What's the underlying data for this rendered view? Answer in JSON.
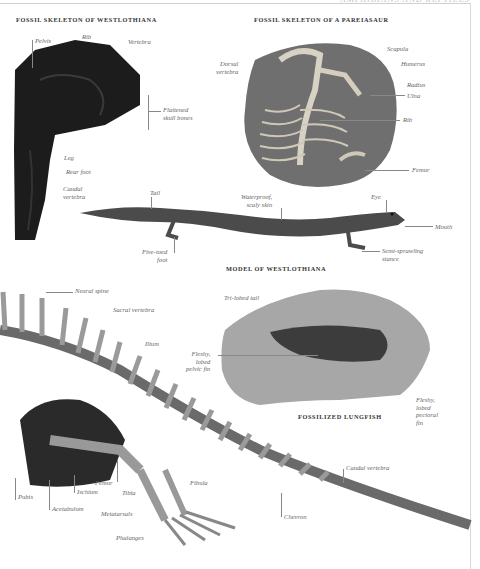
{
  "page": {
    "running_head": "AMPHIBIANS AND REPTILES"
  },
  "sections": {
    "westlothiana_fossil": {
      "title": "FOSSIL SKELETON OF WESTLOTHIANA",
      "labels": {
        "pelvis": "Pelvis",
        "rib": "Rib",
        "vertebra": "Vertebra",
        "flattened_skull_1": "Flattened",
        "flattened_skull_2": "skull bones",
        "leg": "Leg",
        "rear_foot": "Rear foot",
        "caudal_1": "Caudal",
        "caudal_2": "vertebra"
      }
    },
    "pareiasaur_fossil": {
      "title": "FOSSIL SKELETON OF A PAREIASAUR",
      "labels": {
        "dorsal_1": "Dorsal",
        "dorsal_2": "vertebra",
        "scapula": "Scapula",
        "humerus": "Humerus",
        "radius": "Radius",
        "ulna": "Ulna",
        "rib": "Rib",
        "femur": "Femur"
      }
    },
    "westlothiana_model": {
      "title": "MODEL OF WESTLOTHIANA",
      "labels": {
        "tail": "Tail",
        "skin_1": "Waterproof,",
        "skin_2": "scaly skin",
        "eye": "Eye",
        "mouth": "Mouth",
        "foot_1": "Five-toed",
        "foot_2": "foot",
        "stance_1": "Semi-sprawling",
        "stance_2": "stance"
      }
    },
    "lungfish_fossil": {
      "title": "FOSSILIZED LUNGFISH",
      "labels": {
        "tail": "Tri-lobed tail",
        "pelvic_1": "Fleshy,",
        "pelvic_2": "lobed",
        "pelvic_3": "pelvic fin",
        "pectoral_1": "Fleshy,",
        "pectoral_2": "lobed",
        "pectoral_3": "pectoral",
        "pectoral_4": "fin"
      }
    },
    "reptile_skeleton": {
      "labels": {
        "neural_spine": "Neural spine",
        "sacral_vertebra": "Sacral vertebra",
        "ilium": "Ilium",
        "femur": "Femur",
        "fibula": "Fibula",
        "pubis": "Pubis",
        "ischium": "Ischium",
        "tibia": "Tibia",
        "acetabulum": "Acetabulum",
        "metatarsals": "Metatarsals",
        "phalanges": "Phalanges",
        "caudal_vertebra": "Caudal vertebra",
        "chevron": "Chevron"
      }
    }
  }
}
